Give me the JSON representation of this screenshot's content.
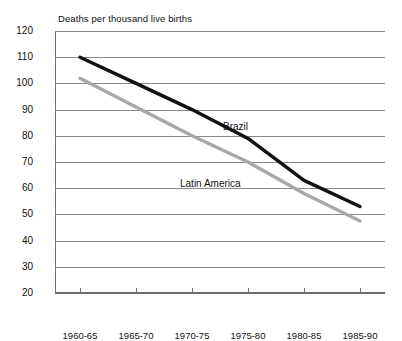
{
  "chart_data": {
    "type": "line",
    "title": "Deaths per thousand live births",
    "xlabel": "",
    "ylabel": "",
    "categories": [
      "1960-65",
      "1965-70",
      "1970-75",
      "1975-80",
      "1980-85",
      "1985-90"
    ],
    "ylim": [
      20,
      120
    ],
    "yticks": [
      20,
      30,
      40,
      50,
      60,
      70,
      80,
      90,
      100,
      110,
      120
    ],
    "grid": true,
    "legend_position": "inline-annotations",
    "series": [
      {
        "name": "Brazil",
        "color": "#111111",
        "values": [
          110,
          100,
          90,
          79,
          63,
          53
        ]
      },
      {
        "name": "Latin America",
        "color": "#a8a8a8",
        "values": [
          102,
          91,
          80,
          70,
          58,
          47.5
        ]
      }
    ],
    "annotations": [
      {
        "text": "Brazil",
        "series": "Brazil"
      },
      {
        "text": "Latin America",
        "series": "Latin America"
      }
    ]
  },
  "axis": {
    "y_tick_labels": [
      "120",
      "110",
      "100",
      "90",
      "80",
      "70",
      "60",
      "50",
      "40",
      "30",
      "20"
    ],
    "x_tick_labels": [
      "1960-65",
      "1965-70",
      "1970-75",
      "1975-80",
      "1980-85",
      "1985-90"
    ]
  }
}
